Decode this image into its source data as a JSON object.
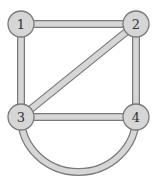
{
  "graph": {
    "colors": {
      "fill": "#d6d6d6",
      "stroke": "#7a7a7a",
      "label": "#333333",
      "background": "#ffffff"
    },
    "nodes": [
      {
        "id": "1",
        "label": "1",
        "x": 21,
        "y": 24
      },
      {
        "id": "2",
        "label": "2",
        "x": 136,
        "y": 24
      },
      {
        "id": "3",
        "label": "3",
        "x": 21,
        "y": 117
      },
      {
        "id": "4",
        "label": "4",
        "x": 136,
        "y": 117
      }
    ],
    "edges": [
      {
        "from": "1",
        "to": "2",
        "type": "straight"
      },
      {
        "from": "1",
        "to": "3",
        "type": "straight"
      },
      {
        "from": "2",
        "to": "3",
        "type": "straight"
      },
      {
        "from": "2",
        "to": "4",
        "type": "straight"
      },
      {
        "from": "3",
        "to": "4",
        "type": "straight"
      },
      {
        "from": "3",
        "to": "4",
        "type": "arc"
      }
    ]
  }
}
